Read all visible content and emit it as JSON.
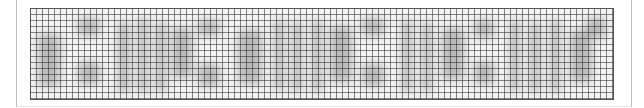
{
  "captcha": {
    "description": "Obscured verification image (characters intentionally not transcribed)",
    "grid": {
      "cell_px": 6,
      "line_color": "#282828"
    },
    "colors": {
      "background": "#f4f4f4",
      "frame": "#bdbdbd",
      "blob": "#8a8a8a"
    },
    "blobs": [
      {
        "x": 8,
        "y": 26,
        "w": 22,
        "h": 52
      },
      {
        "x": 48,
        "y": 10,
        "w": 22,
        "h": 18
      },
      {
        "x": 48,
        "y": 54,
        "w": 22,
        "h": 22
      },
      {
        "x": 88,
        "y": 14,
        "w": 12,
        "h": 70
      },
      {
        "x": 108,
        "y": 10,
        "w": 10,
        "h": 74
      },
      {
        "x": 126,
        "y": 14,
        "w": 10,
        "h": 70
      },
      {
        "x": 142,
        "y": 20,
        "w": 20,
        "h": 50
      },
      {
        "x": 168,
        "y": 12,
        "w": 22,
        "h": 16
      },
      {
        "x": 168,
        "y": 56,
        "w": 22,
        "h": 22
      },
      {
        "x": 208,
        "y": 22,
        "w": 24,
        "h": 54
      },
      {
        "x": 244,
        "y": 12,
        "w": 10,
        "h": 70
      },
      {
        "x": 262,
        "y": 14,
        "w": 10,
        "h": 70
      },
      {
        "x": 282,
        "y": 12,
        "w": 10,
        "h": 72
      },
      {
        "x": 300,
        "y": 18,
        "w": 22,
        "h": 56
      },
      {
        "x": 332,
        "y": 10,
        "w": 22,
        "h": 18
      },
      {
        "x": 332,
        "y": 56,
        "w": 22,
        "h": 22
      },
      {
        "x": 372,
        "y": 12,
        "w": 10,
        "h": 72
      },
      {
        "x": 392,
        "y": 14,
        "w": 10,
        "h": 70
      },
      {
        "x": 412,
        "y": 20,
        "w": 22,
        "h": 52
      },
      {
        "x": 444,
        "y": 12,
        "w": 20,
        "h": 18
      },
      {
        "x": 444,
        "y": 54,
        "w": 20,
        "h": 22
      },
      {
        "x": 480,
        "y": 12,
        "w": 10,
        "h": 72
      },
      {
        "x": 500,
        "y": 14,
        "w": 10,
        "h": 70
      },
      {
        "x": 520,
        "y": 12,
        "w": 10,
        "h": 72
      },
      {
        "x": 540,
        "y": 22,
        "w": 22,
        "h": 52
      },
      {
        "x": 556,
        "y": 10,
        "w": 20,
        "h": 20
      }
    ]
  }
}
